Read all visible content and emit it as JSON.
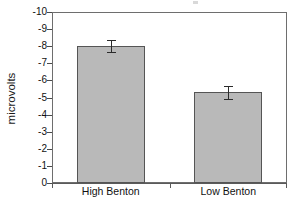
{
  "chart_data": {
    "type": "bar",
    "title": "",
    "xlabel": "",
    "ylabel": "microvolts",
    "categories": [
      "High Benton",
      "Low Benton"
    ],
    "values": [
      -8.0,
      -5.3
    ],
    "errors": [
      0.35,
      0.38
    ],
    "yticks": [
      "-10",
      "-9",
      "-8",
      "-7",
      "-6",
      "-5",
      "-4",
      "-3",
      "-2",
      "-1",
      "0"
    ],
    "ytick_values": [
      -10,
      -9,
      -8,
      -7,
      -6,
      -5,
      -4,
      -3,
      -2,
      -1,
      0
    ],
    "ylim": [
      -10,
      0
    ],
    "y_axis_inverted": true,
    "grid": false,
    "legend": null,
    "bar_color": "#b9b9b9",
    "bar_edge_color": "#555555",
    "error_bar_color": "#2b2b2b",
    "axis_color": "#6e6e6e"
  }
}
